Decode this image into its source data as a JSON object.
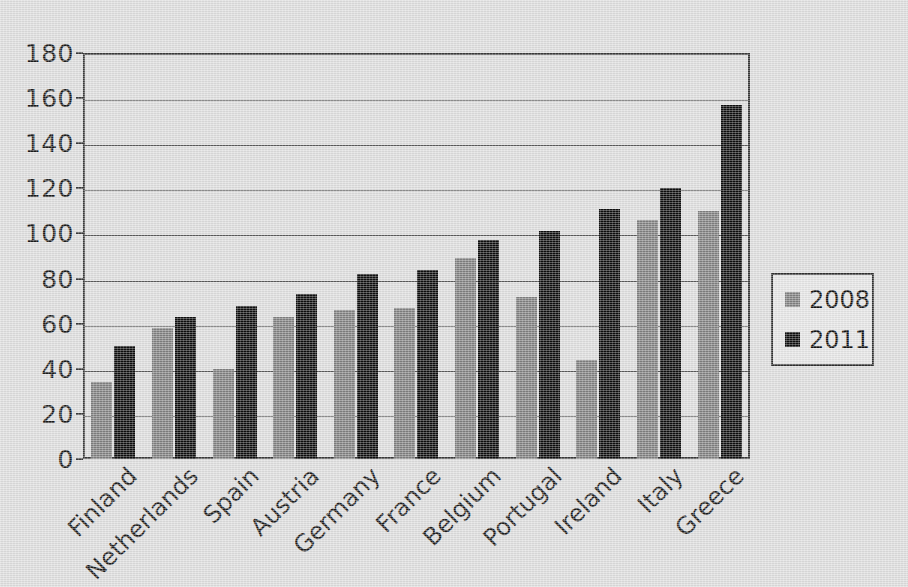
{
  "chart_data": {
    "type": "bar",
    "title": "",
    "subtitle": "",
    "xlabel": "",
    "ylabel": "",
    "categories": [
      "Finland",
      "Netherlands",
      "Spain",
      "Austria",
      "Germany",
      "France",
      "Belgium",
      "Portugal",
      "Ireland",
      "Italy",
      "Greece"
    ],
    "series": [
      {
        "name": "2008",
        "color": "#7f7f7f",
        "values": [
          34,
          58,
          40,
          63,
          66,
          67,
          89,
          72,
          44,
          106,
          110
        ]
      },
      {
        "name": "2011",
        "color": "#0d0d0d",
        "values": [
          50,
          63,
          68,
          73,
          82,
          84,
          97,
          101,
          111,
          120,
          157
        ]
      }
    ],
    "ylim": [
      0,
      180
    ],
    "ytick_step": 20,
    "yticks": [
      "0",
      "20",
      "40",
      "60",
      "80",
      "100",
      "120",
      "140",
      "160",
      "180"
    ],
    "grid": true,
    "legend_position": "right",
    "legend_entries": [
      "2008",
      "2011"
    ],
    "annotations": []
  },
  "colors": {
    "background": "#dcdcdc",
    "axis": "#3a3a3a",
    "gridline": "#5a5a5a",
    "series_2008": "#7f7f7f",
    "series_2011": "#0d0d0d",
    "text": "#1a1a1a"
  }
}
